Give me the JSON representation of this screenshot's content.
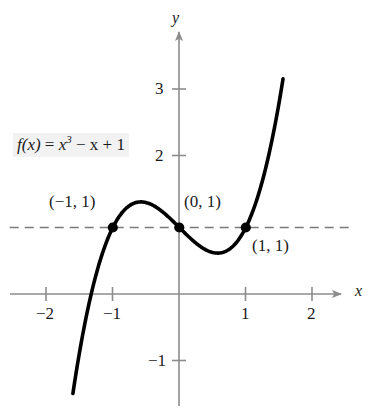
{
  "chart_data": {
    "type": "line",
    "title": "",
    "function_label": "f(x) = x³ − x + 1",
    "expression": "x^3 - x + 1",
    "xlabel": "x",
    "ylabel": "y",
    "xlim": [
      -2.55,
      2.75
    ],
    "ylim": [
      -1.8,
      3.45
    ],
    "xticks": [
      -2,
      -1,
      1,
      2
    ],
    "xtick_labels": [
      "−2",
      "−1",
      "1",
      "2"
    ],
    "yticks": [
      -1,
      2,
      3
    ],
    "ytick_labels": [
      "−1",
      "2",
      "3"
    ],
    "grid": false,
    "legend": "none",
    "curve_domain": [
      -1.6,
      1.56
    ],
    "curve_color": "#000000",
    "axis_color": "#8c8c8c",
    "reference_line": {
      "name": "y-equals-one-dashed",
      "type": "horizontal",
      "y": 1,
      "x_start": -2.55,
      "x_end": 2.55,
      "style": "dashed",
      "color": "#7a7a7a"
    },
    "points": [
      {
        "label": "(−1, 1)",
        "x": -1,
        "y": 1
      },
      {
        "label": "(0, 1)",
        "x": 0,
        "y": 1
      },
      {
        "label": "(1, 1)",
        "x": 1,
        "y": 1
      }
    ],
    "series": [
      {
        "name": "f(x) = x^3 - x + 1",
        "x": [
          -1.6,
          -1.5,
          -1.4,
          -1.3,
          -1.2,
          -1.1,
          -1.0,
          -0.9,
          -0.8,
          -0.7,
          -0.6,
          -0.5,
          -0.4,
          -0.3,
          -0.2,
          -0.1,
          0.0,
          0.1,
          0.2,
          0.3,
          0.4,
          0.5,
          0.6,
          0.7,
          0.8,
          0.9,
          1.0,
          1.1,
          1.2,
          1.3,
          1.4,
          1.5,
          1.56
        ],
        "y": [
          -1.496,
          -0.875,
          -0.344,
          0.103,
          0.472,
          0.769,
          1.0,
          1.171,
          1.288,
          1.357,
          1.384,
          1.375,
          1.336,
          1.273,
          1.192,
          1.099,
          1.0,
          0.901,
          0.808,
          0.727,
          0.664,
          0.625,
          0.616,
          0.643,
          0.712,
          0.829,
          1.0,
          1.231,
          1.528,
          1.897,
          2.344,
          2.875,
          3.237
        ]
      }
    ]
  },
  "labels": {
    "formula_prefix": "f(x)",
    "formula_eq": " = ",
    "formula_x": "x",
    "formula_exp": "3",
    "formula_rest": " − x + 1",
    "x_axis": "x",
    "y_axis": "y",
    "tick_neg2": "−2",
    "tick_neg1x": "−1",
    "tick_1": "1",
    "tick_2": "2",
    "tick_3y": "3",
    "tick_2y": "2",
    "tick_neg1y": "−1",
    "point_left": "(−1, 1)",
    "point_mid": "(0, 1)",
    "point_right": "(1, 1)"
  }
}
